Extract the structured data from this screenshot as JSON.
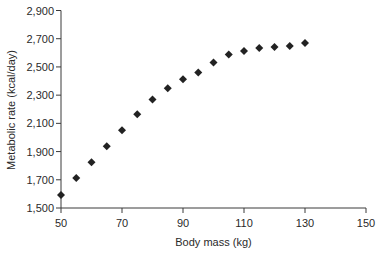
{
  "chart_data": {
    "type": "scatter",
    "title": "",
    "xlabel": "Body mass (kg)",
    "ylabel": "Metabolic rate (kcal/day)",
    "xlim": [
      50,
      150
    ],
    "ylim": [
      1500,
      2900
    ],
    "x_ticks": [
      50,
      70,
      90,
      110,
      130,
      150
    ],
    "x_tick_labels": [
      "50",
      "70",
      "90",
      "110",
      "130",
      "150"
    ],
    "y_ticks": [
      1500,
      1700,
      1900,
      2100,
      2300,
      2500,
      2700,
      2900
    ],
    "y_tick_labels": [
      "1,500",
      "1,700",
      "1,900",
      "2,100",
      "2,300",
      "2,500",
      "2,700",
      "2,900"
    ],
    "grid": false,
    "legend": null,
    "marker": "diamond",
    "series": [
      {
        "name": "Metabolic rate",
        "x": [
          50,
          55,
          60,
          65,
          70,
          75,
          80,
          85,
          90,
          95,
          100,
          105,
          110,
          115,
          120,
          125,
          130
        ],
        "y": [
          1592,
          1712,
          1825,
          1938,
          2051,
          2164,
          2270,
          2348,
          2412,
          2461,
          2532,
          2588,
          2613,
          2635,
          2642,
          2649,
          2670
        ]
      }
    ]
  },
  "colors": {
    "marker": "#222222",
    "axis": "#3a3a3a",
    "text": "#2a2a2a",
    "background": "#ffffff"
  }
}
